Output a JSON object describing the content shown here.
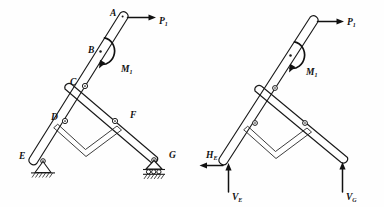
{
  "figure": {
    "type": "engineering-mechanics-schematic",
    "background_color": "#fefefe",
    "line_color": "#1a1a1a"
  },
  "left_diagram": {
    "name": "labeled-structure",
    "joint_labels": [
      {
        "id": "A",
        "text": "A",
        "x": 110,
        "y": 16,
        "desc": "top end of main leg, load application point"
      },
      {
        "id": "B",
        "text": "B",
        "x": 91,
        "y": 52,
        "desc": "moment application point on main leg"
      },
      {
        "id": "C",
        "text": "C",
        "x": 70,
        "y": 86,
        "desc": "pin joint connecting main leg to rear leg"
      },
      {
        "id": "D",
        "text": "D",
        "x": 52,
        "y": 120,
        "desc": "pin joint on main leg for spreader bar"
      },
      {
        "id": "E",
        "text": "E",
        "x": 20,
        "y": 157,
        "desc": "pinned support at base of main leg"
      },
      {
        "id": "F",
        "text": "F",
        "x": 130,
        "y": 119,
        "desc": "pin joint on rear leg for spreader bar"
      },
      {
        "id": "G",
        "text": "G",
        "x": 168,
        "y": 158,
        "desc": "roller support at base of rear leg"
      }
    ],
    "load_label": {
      "base": "P",
      "sub": "1",
      "x": 157,
      "y": 26
    },
    "moment_label": {
      "base": "M",
      "sub": "1",
      "x": 122,
      "y": 70
    },
    "supports": [
      {
        "at": "E",
        "kind": "pinned-support"
      },
      {
        "at": "G",
        "kind": "roller-support"
      }
    ]
  },
  "right_diagram": {
    "name": "free-body-diagram",
    "load_label": {
      "base": "P",
      "sub": "1",
      "x": 345,
      "y": 27
    },
    "moment_label": {
      "base": "M",
      "sub": "1",
      "x": 307,
      "y": 73
    },
    "reactions": [
      {
        "base": "H",
        "sub": "E",
        "x": 209,
        "y": 158,
        "direction": "left",
        "desc": "horizontal reaction at E"
      },
      {
        "base": "V",
        "sub": "E",
        "x": 236,
        "y": 196,
        "direction": "up",
        "desc": "vertical reaction at E"
      },
      {
        "base": "V",
        "sub": "G",
        "x": 349,
        "y": 196,
        "direction": "up",
        "desc": "vertical reaction at G"
      }
    ]
  }
}
